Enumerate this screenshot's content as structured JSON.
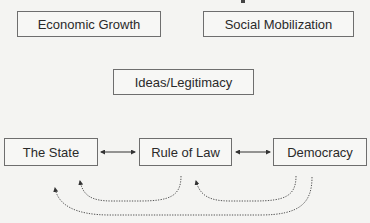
{
  "diagram": {
    "top_boxes": [
      {
        "id": "economic-growth",
        "label": "Economic Growth"
      },
      {
        "id": "social-mobilization",
        "label": "Social Mobilization"
      }
    ],
    "middle_box": {
      "id": "ideas-legitimacy",
      "label": "Ideas/Legitimacy"
    },
    "bottom_boxes": [
      {
        "id": "the-state",
        "label": "The State"
      },
      {
        "id": "rule-of-law",
        "label": "Rule of Law"
      },
      {
        "id": "democracy",
        "label": "Democracy"
      }
    ],
    "connections": [
      {
        "from": "The State",
        "to": "Rule of Law",
        "style": "solid",
        "direction": "bidirectional"
      },
      {
        "from": "Rule of Law",
        "to": "Democracy",
        "style": "solid",
        "direction": "bidirectional"
      },
      {
        "from": "Rule of Law",
        "to": "The State",
        "style": "dotted",
        "direction": "curved-feedback"
      },
      {
        "from": "Democracy",
        "to": "Rule of Law",
        "style": "dotted",
        "direction": "curved-feedback"
      },
      {
        "from": "Democracy",
        "to": "The State",
        "style": "dotted",
        "direction": "curved-feedback"
      }
    ],
    "colors": {
      "border": "#6e6e6e",
      "text": "#2a2a2a",
      "background": "#f4f4f2",
      "arrow": "#333333"
    }
  }
}
